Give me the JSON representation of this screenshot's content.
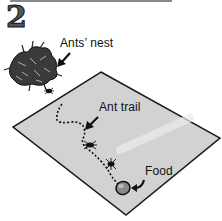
{
  "figure": {
    "step_number": "2",
    "labels": {
      "nest": "Ants’ nest",
      "trail": "Ant trail",
      "food": "Food"
    },
    "colors": {
      "mat_fill": "#d2d2d2",
      "outline": "#1a1a1a",
      "nest_fill": "#3a3a3a",
      "food_fill": "#8a8a8a",
      "background": "#ffffff"
    },
    "icons": {
      "nest": "ants-nest-icon",
      "ant": "ant-icon",
      "food": "food-icon",
      "arrow": "pointer-arrow-icon"
    }
  }
}
